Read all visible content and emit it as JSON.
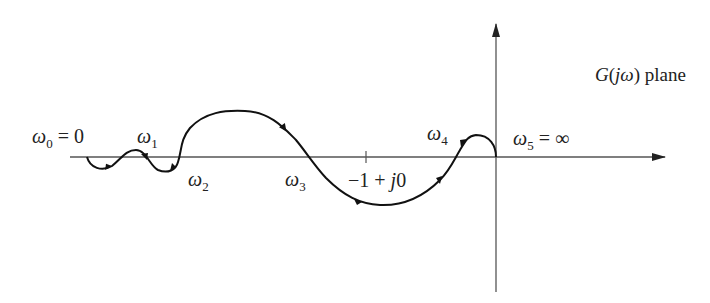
{
  "diagram": {
    "title": "G(jω) plane",
    "title_parts": {
      "G": "G",
      "open": "(",
      "j": "j",
      "omega": "ω",
      "close": ")",
      "word": " plane"
    },
    "axes": {
      "real_axis": {
        "y": 157,
        "x_start": 70,
        "x_end": 665
      },
      "imag_axis": {
        "x": 496,
        "y_start": 25,
        "y_end": 292
      }
    },
    "critical_point": {
      "label": "−1 + j0",
      "parts": {
        "minus_one": "−1 + ",
        "j": "j",
        "zero": "0"
      },
      "x": 366
    },
    "frequency_labels": [
      {
        "id": "w0",
        "symbol": "ω",
        "sub": "0",
        "suffix": " = 0"
      },
      {
        "id": "w1",
        "symbol": "ω",
        "sub": "1",
        "suffix": ""
      },
      {
        "id": "w2",
        "symbol": "ω",
        "sub": "2",
        "suffix": ""
      },
      {
        "id": "w3",
        "symbol": "ω",
        "sub": "3",
        "suffix": ""
      },
      {
        "id": "w4",
        "symbol": "ω",
        "sub": "4",
        "suffix": ""
      },
      {
        "id": "w5",
        "symbol": "ω",
        "sub": "5",
        "suffix": " = ∞"
      }
    ],
    "colors": {
      "curve": "#111111",
      "axis": "#555555",
      "text": "#222222"
    }
  }
}
